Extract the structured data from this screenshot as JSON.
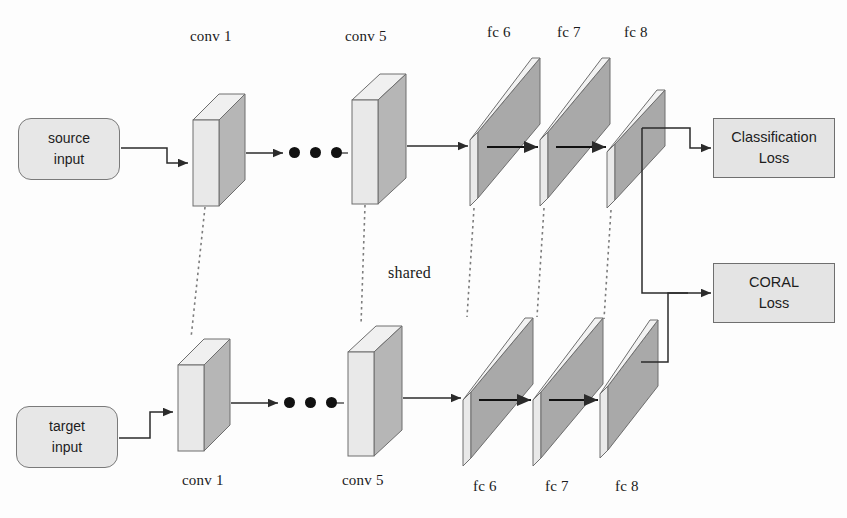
{
  "figure": {
    "colors": {
      "slab_face": "#a9a9a9",
      "slab_edge": "#e9e9e9",
      "slab_stroke": "#6e6e6e",
      "cube_front": "#e9e9e9",
      "cube_side": "#b6b6b6",
      "cube_top": "#f0f0f0",
      "box_fill": "#e4e4e4",
      "line": "#2b2b2b",
      "dotted": "#7d7d7d"
    }
  },
  "inputs": {
    "source": {
      "line1": "source",
      "line2": "input"
    },
    "target": {
      "line1": "target",
      "line2": "input"
    }
  },
  "losses": {
    "classification": {
      "line1": "Classification",
      "line2": "Loss"
    },
    "coral": {
      "line1": "CORAL",
      "line2": "Loss"
    }
  },
  "shared_label": "shared",
  "labels_top": [
    {
      "text": "conv 1",
      "x": 190,
      "y": 28
    },
    {
      "text": "conv 5",
      "x": 345,
      "y": 28
    },
    {
      "text": "fc 6",
      "x": 487,
      "y": 24
    },
    {
      "text": "fc 7",
      "x": 557,
      "y": 24
    },
    {
      "text": "fc 8",
      "x": 624,
      "y": 24
    }
  ],
  "labels_bottom": [
    {
      "text": "conv 1",
      "x": 182,
      "y": 472
    },
    {
      "text": "conv 5",
      "x": 342,
      "y": 472
    },
    {
      "text": "fc 6",
      "x": 473,
      "y": 478
    },
    {
      "text": "fc 7",
      "x": 545,
      "y": 478
    },
    {
      "text": "fc 8",
      "x": 615,
      "y": 478
    }
  ],
  "stream_top": {
    "conv1": {
      "x": 193,
      "y": 120,
      "w": 25,
      "h": 86,
      "d": 26
    },
    "conv5": {
      "x": 352,
      "y": 100,
      "w": 26,
      "h": 104,
      "d": 28
    },
    "fc": [
      {
        "name": "fc 6",
        "x": 470,
        "y": 58,
        "w": 62,
        "h": 148,
        "skew": 62
      },
      {
        "name": "fc 7",
        "x": 540,
        "y": 58,
        "w": 62,
        "h": 148,
        "skew": 62
      },
      {
        "name": "fc 8",
        "x": 607,
        "y": 90,
        "w": 50,
        "h": 118,
        "skew": 50
      }
    ]
  },
  "stream_bottom": {
    "conv1": {
      "x": 178,
      "y": 365,
      "w": 25,
      "h": 86,
      "d": 26
    },
    "conv5": {
      "x": 348,
      "y": 352,
      "w": 26,
      "h": 104,
      "d": 28
    },
    "fc": [
      {
        "name": "fc 6",
        "x": 463,
        "y": 318,
        "w": 62,
        "h": 148,
        "skew": 62
      },
      {
        "name": "fc 7",
        "x": 533,
        "y": 318,
        "w": 62,
        "h": 148,
        "skew": 62
      },
      {
        "name": "fc 8",
        "x": 600,
        "y": 320,
        "w": 50,
        "h": 138,
        "skew": 50
      }
    ]
  },
  "dots": {
    "top": {
      "x": 292,
      "y": 150,
      "count": 3
    },
    "bottom": {
      "x": 288,
      "y": 400,
      "count": 3
    }
  }
}
